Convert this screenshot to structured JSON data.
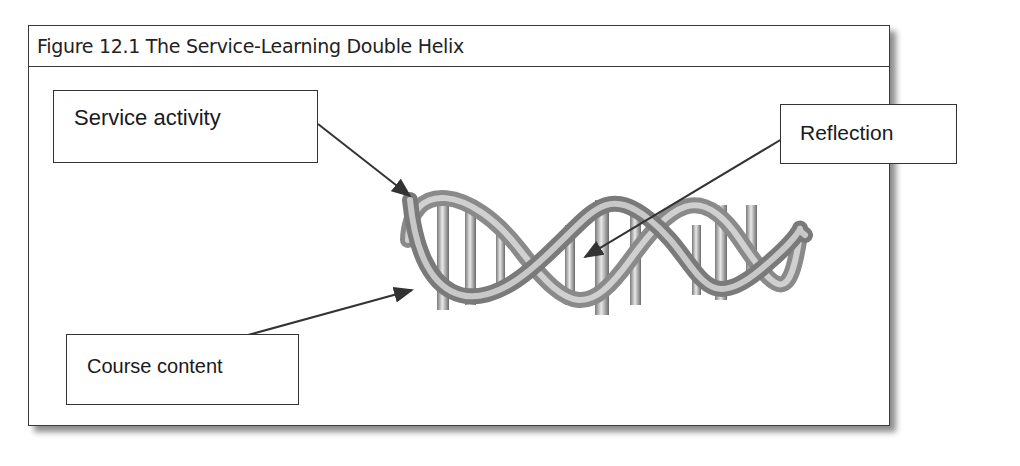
{
  "figure": {
    "title": "Figure 12.1 The Service-Learning Double Helix",
    "labels": {
      "service_activity": "Service activity",
      "reflection": "Reflection",
      "course_content": "Course content"
    },
    "illustration": "dna-double-helix",
    "colors": {
      "border": "#3a3a3a",
      "text": "#1a1a1a",
      "helix": "#9a9a9a"
    }
  }
}
